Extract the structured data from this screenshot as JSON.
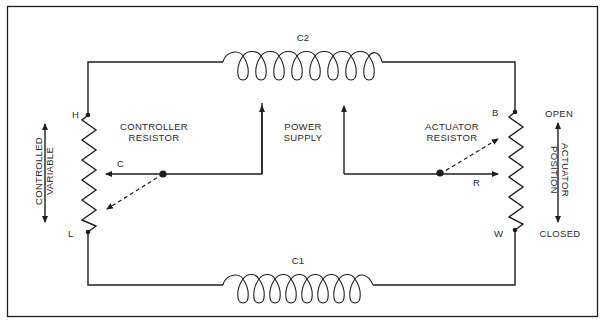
{
  "diagram": {
    "type": "circuit-schematic",
    "components": {
      "coil_top": {
        "label": "C2"
      },
      "coil_bottom": {
        "label": "C1"
      },
      "controller_resistor": {
        "title_line1": "CONTROLLER",
        "title_line2": "RESISTOR",
        "top_terminal": "H",
        "bottom_terminal": "L",
        "wiper": "C"
      },
      "actuator_resistor": {
        "title_line1": "ACTUATOR",
        "title_line2": "RESISTOR",
        "top_terminal": "B",
        "bottom_terminal": "W",
        "wiper": "R"
      },
      "power_supply": {
        "line1": "POWER",
        "line2": "SUPPLY"
      }
    },
    "side_labels": {
      "left_line1": "CONTROLLED",
      "left_line2": "VARIABLE",
      "right_line1": "ACTUATOR",
      "right_line2": "POSITION",
      "right_top": "OPEN",
      "right_bottom": "CLOSED"
    },
    "colors": {
      "ink": "#1f1f1f",
      "background": "#ffffff"
    }
  }
}
